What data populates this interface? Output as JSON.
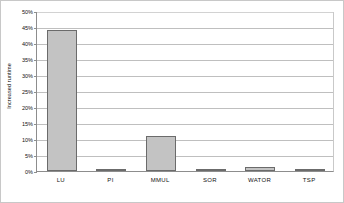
{
  "chart_data": {
    "type": "bar",
    "title": "",
    "xlabel": "",
    "ylabel": "Increased runtime",
    "categories": [
      "LU",
      "PI",
      "MMUL",
      "SOR",
      "WATOR",
      "TSP"
    ],
    "values": [
      44,
      0.3,
      10.8,
      0.1,
      1.2,
      0.6
    ],
    "ylim": [
      0,
      50
    ],
    "ytick_labels": [
      "0%",
      "5%",
      "10%",
      "15%",
      "20%",
      "25%",
      "30%",
      "35%",
      "40%",
      "45%",
      "50%"
    ],
    "ytick_values": [
      0,
      5,
      10,
      15,
      20,
      25,
      30,
      35,
      40,
      45,
      50
    ],
    "grid": true,
    "legend": false,
    "bar_fill_color": "#c3c3c3",
    "bar_border_color": "#6b6b6b",
    "gridline_color": "#bfbfbf",
    "axis_color": "#8d8d8d"
  }
}
